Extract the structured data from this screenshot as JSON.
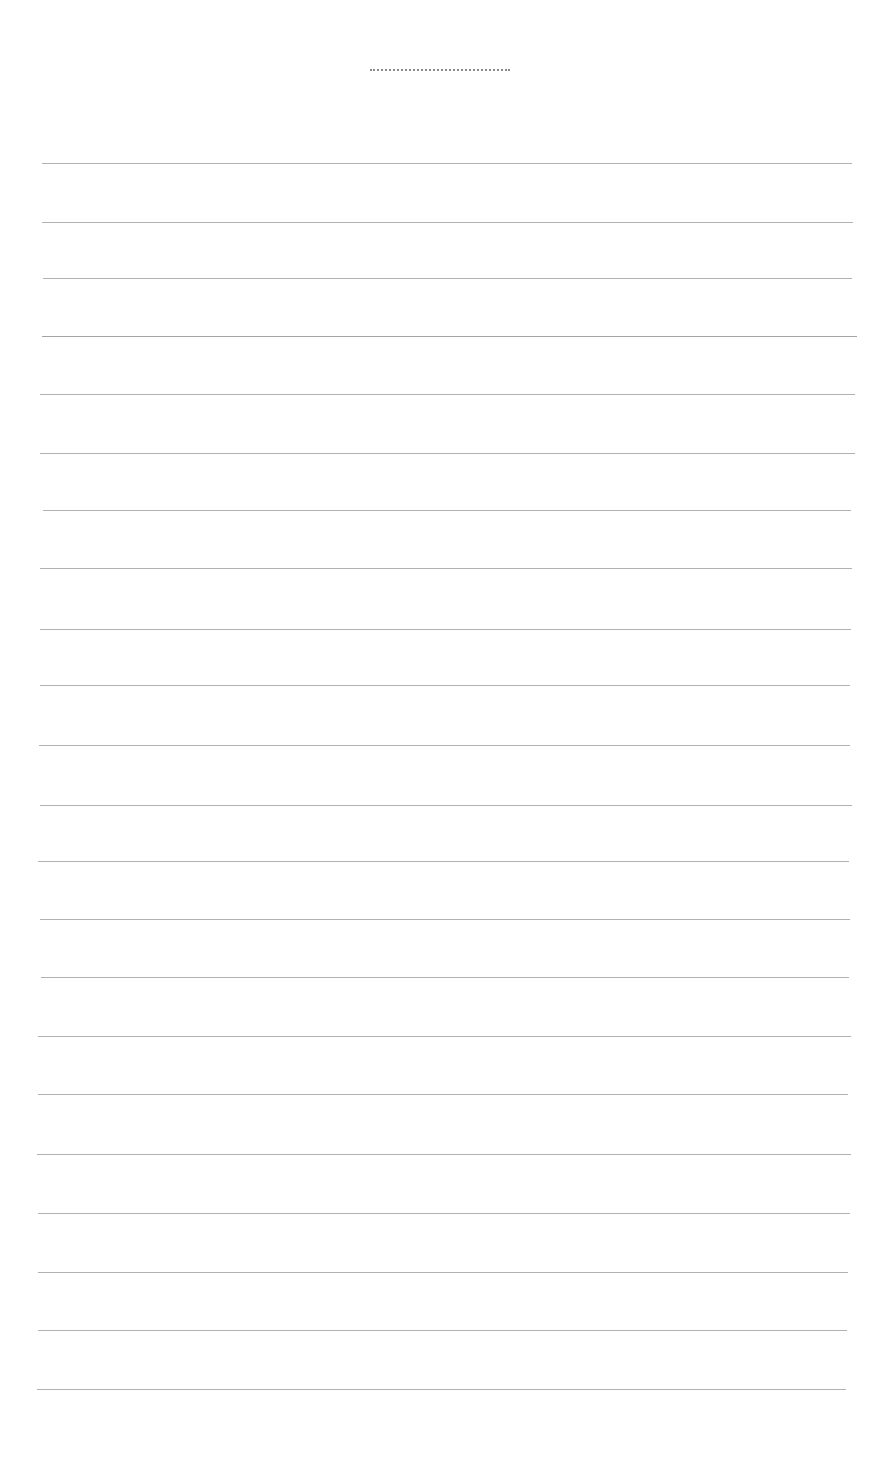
{
  "page": {
    "type": "lined-writing-sheet",
    "background": "#ffffff",
    "line_color": "#a8a8a8",
    "title_line": {
      "x1": 370,
      "x2": 510,
      "y": 69,
      "color": "#8a8a8a"
    },
    "ruled_lines": [
      {
        "y": 163,
        "x1": 42,
        "x2": 852
      },
      {
        "y": 222,
        "x1": 42,
        "x2": 853
      },
      {
        "y": 278,
        "x1": 43,
        "x2": 852
      },
      {
        "y": 336,
        "x1": 42,
        "x2": 857
      },
      {
        "y": 394,
        "x1": 40,
        "x2": 855
      },
      {
        "y": 453,
        "x1": 40,
        "x2": 855
      },
      {
        "y": 510,
        "x1": 43,
        "x2": 851
      },
      {
        "y": 568,
        "x1": 40,
        "x2": 852
      },
      {
        "y": 629,
        "x1": 40,
        "x2": 851
      },
      {
        "y": 685,
        "x1": 40,
        "x2": 850
      },
      {
        "y": 745,
        "x1": 39,
        "x2": 850
      },
      {
        "y": 805,
        "x1": 40,
        "x2": 852
      },
      {
        "y": 861,
        "x1": 38,
        "x2": 849
      },
      {
        "y": 919,
        "x1": 40,
        "x2": 850
      },
      {
        "y": 977,
        "x1": 41,
        "x2": 849
      },
      {
        "y": 1036,
        "x1": 38,
        "x2": 851
      },
      {
        "y": 1094,
        "x1": 38,
        "x2": 848
      },
      {
        "y": 1154,
        "x1": 37,
        "x2": 851
      },
      {
        "y": 1213,
        "x1": 38,
        "x2": 850
      },
      {
        "y": 1272,
        "x1": 38,
        "x2": 848
      },
      {
        "y": 1330,
        "x1": 38,
        "x2": 847
      },
      {
        "y": 1389,
        "x1": 37,
        "x2": 846
      }
    ]
  }
}
